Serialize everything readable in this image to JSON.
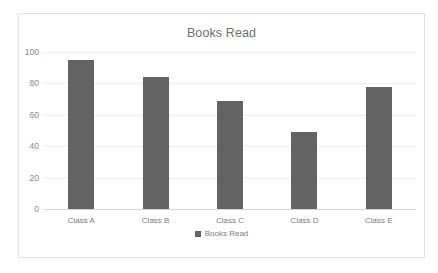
{
  "chart_data": {
    "type": "bar",
    "title": "Books Read",
    "xlabel": "",
    "ylabel": "",
    "categories": [
      "Class A",
      "Class B",
      "Class C",
      "Class D",
      "Class E"
    ],
    "values": [
      95,
      84,
      69,
      49,
      78
    ],
    "series": [
      {
        "name": "Books Read",
        "values": [
          95,
          84,
          69,
          49,
          78
        ]
      }
    ],
    "ylim": [
      0,
      100
    ],
    "yticks": [
      0,
      20,
      40,
      60,
      80,
      100
    ],
    "ytick_labels": [
      "0",
      "20",
      "40",
      "60",
      "80",
      "100"
    ],
    "grid": true,
    "legend": {
      "position": "bottom",
      "entries": [
        "Books Read"
      ]
    },
    "colors": {
      "bar": "#636363",
      "title_text": "#6f6f6f",
      "tick_text": "#7d7d7d",
      "gridline": "#ededed",
      "axis_line": "#d6d6d6",
      "border": "#e2e2e2",
      "background": "#ffffff"
    }
  }
}
